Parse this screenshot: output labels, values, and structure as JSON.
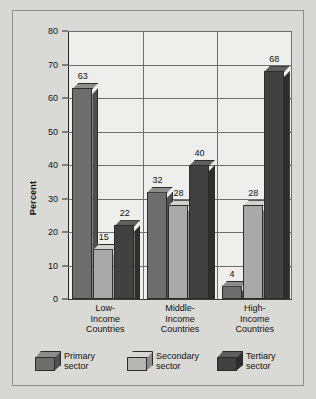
{
  "chart_data": {
    "type": "bar",
    "title": "",
    "xlabel": "",
    "ylabel": "Percent",
    "ylim": [
      0,
      80
    ],
    "yticks": [
      0,
      10,
      20,
      30,
      40,
      50,
      60,
      70,
      80
    ],
    "grid": true,
    "legend_position": "bottom",
    "categories": [
      "Low-\nIncome\nCountries",
      "Middle-\nIncome\nCountries",
      "High-\nIncome\nCountries"
    ],
    "category_labels": [
      [
        "Low-",
        "Income",
        "Countries"
      ],
      [
        "Middle-",
        "Income",
        "Countries"
      ],
      [
        "High-",
        "Income",
        "Countries"
      ]
    ],
    "series": [
      {
        "name": "Primary sector",
        "values": [
          63,
          32,
          4
        ],
        "color": "#6e6e6e"
      },
      {
        "name": "Secondary sector",
        "values": [
          15,
          28,
          28
        ],
        "color": "#a9a9a9"
      },
      {
        "name": "Tertiary sector",
        "values": [
          22,
          40,
          68
        ],
        "color": "#414141"
      }
    ],
    "data_labels": [
      "63",
      "15",
      "22",
      "32",
      "28",
      "40",
      "4",
      "28",
      "68"
    ]
  },
  "axis": {
    "y_title": "Percent",
    "y_tick_labels": [
      "80",
      "70",
      "60",
      "50",
      "40",
      "30",
      "20",
      "10",
      "0"
    ]
  },
  "legend": {
    "items": [
      {
        "label_line1": "Primary",
        "label_line2": "sector",
        "label": "Primary\nsector"
      },
      {
        "label_line1": "Secondary",
        "label_line2": "sector",
        "label": "Secondary\nsector"
      },
      {
        "label_line1": "Tertiary",
        "label_line2": "sector",
        "label": "Tertiary\nsector"
      }
    ]
  },
  "colors": {
    "page_background": "#d7d7d3",
    "panel_background": "#d9d9d5",
    "plot_background": "#eeeeec",
    "gridline": "#6f6f6f",
    "axis": "#262626",
    "primary_sector": "#6e6e6e",
    "secondary_sector": "#a9a9a9",
    "tertiary_sector": "#414141"
  }
}
